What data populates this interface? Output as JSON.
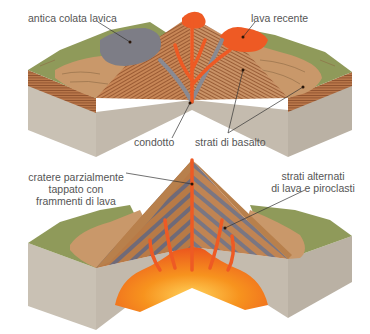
{
  "diagram": {
    "top": {
      "title": "shield volcano cross-section",
      "labels": {
        "old_flow": "antica colata lavica",
        "recent_lava": "lava recente",
        "conduit": "condotto",
        "basalt_layers": "strati di basalto"
      }
    },
    "bottom": {
      "title": "stratovolcano cross-section",
      "labels": {
        "crater_line1": "cratere parzialmente",
        "crater_line2": "tappato con",
        "crater_line3": "frammenti di lava",
        "layers_line1": "strati alternati",
        "layers_line2": "di lava e piroclasti"
      }
    },
    "colors": {
      "grass": "#8f9a5a",
      "tan": "#c9986a",
      "strata": "#a8653a",
      "bedrock": "#c8bfb2",
      "bedrock_dark": "#b5ac9f",
      "old_lava": "#7d7d86",
      "lava": "#ee5a24",
      "magma": "#f7931e",
      "label": "#555555"
    }
  }
}
